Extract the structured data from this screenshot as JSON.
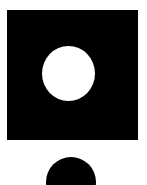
{
  "image": {
    "width": 147,
    "height": 185,
    "background_color": "#ffffff",
    "description": "Abstract black and white geometric graphic"
  },
  "palette": {
    "foreground": "#000000",
    "background": "#ffffff"
  },
  "shapes": [
    {
      "name": "square",
      "role": "outer-square",
      "fill": "#000000",
      "x": 7,
      "y": 10,
      "width": 131,
      "height": 130,
      "label": "Black square"
    },
    {
      "name": "inner-circle",
      "role": "knockout-circle",
      "fill": "#ffffff",
      "cx": 68,
      "cy": 73,
      "width": 53,
      "height": 55,
      "label": "White circle"
    },
    {
      "name": "bottom-circle",
      "role": "clipped-circle",
      "fill": "#000000",
      "cx": 71,
      "cy": 182,
      "width": 50,
      "height": 50,
      "clipped": "bottom",
      "label": "Black circle clipped by canvas edge"
    }
  ]
}
